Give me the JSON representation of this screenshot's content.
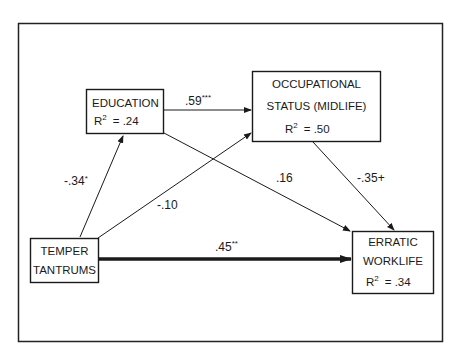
{
  "diagram": {
    "type": "path-diagram",
    "nodes": {
      "education": {
        "line1": "EDUCATION",
        "r2_label": "R",
        "r2_sup": "2",
        "r2_value": "=  .24"
      },
      "occupational": {
        "line1": "OCCUPATIONAL",
        "line2": "STATUS (MIDLIFE)",
        "r2_label": "R",
        "r2_sup": "2",
        "r2_value": "=  .50"
      },
      "temper": {
        "line1": "TEMPER",
        "line2": "TANTRUMS"
      },
      "erratic": {
        "line1": "ERRATIC",
        "line2": "WORKLIFE",
        "r2_label": "R",
        "r2_sup": "2",
        "r2_value": "=  .34"
      }
    },
    "edges": [
      {
        "from": "temper",
        "to": "education",
        "coef": "-.34",
        "sig": "*"
      },
      {
        "from": "education",
        "to": "occupational",
        "coef": ".59",
        "sig": "***"
      },
      {
        "from": "temper",
        "to": "occupational",
        "coef": "-.10",
        "sig": ""
      },
      {
        "from": "education",
        "to": "erratic",
        "coef": ".16",
        "sig": ""
      },
      {
        "from": "occupational",
        "to": "erratic",
        "coef": "-.35+",
        "sig": ""
      },
      {
        "from": "temper",
        "to": "erratic",
        "coef": ".45",
        "sig": "**"
      }
    ]
  }
}
